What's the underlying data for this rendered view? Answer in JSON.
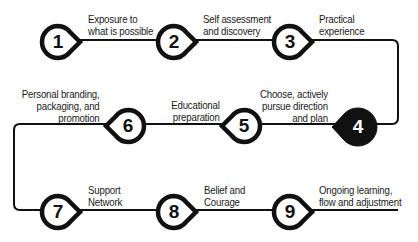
{
  "diagram": {
    "type": "process-flow",
    "direction": "serpentine",
    "colors": {
      "line": "#111111",
      "node_fill": "#ffffff",
      "highlight_fill": "#111111",
      "text": "#1a1a1a"
    },
    "steps": [
      {
        "number": "1",
        "label": "Exposure to\nwhat is possible",
        "highlighted": false
      },
      {
        "number": "2",
        "label": "Self assessment\nand discovery",
        "highlighted": false
      },
      {
        "number": "3",
        "label": "Practical\nexperience",
        "highlighted": false
      },
      {
        "number": "4",
        "label": "Choose, actively\npursue direction\nand plan",
        "highlighted": true
      },
      {
        "number": "5",
        "label": "Educational\npreparation",
        "highlighted": false
      },
      {
        "number": "6",
        "label": "Personal branding,\npackaging, and\npromotion",
        "highlighted": false
      },
      {
        "number": "7",
        "label": "Support\nNetwork",
        "highlighted": false
      },
      {
        "number": "8",
        "label": "Belief and\nCourage",
        "highlighted": false
      },
      {
        "number": "9",
        "label": "Ongoing learning,\nflow and adjustment",
        "highlighted": false
      }
    ]
  }
}
